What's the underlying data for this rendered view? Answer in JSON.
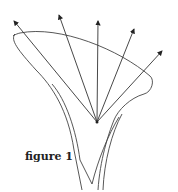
{
  "figure": {
    "caption": "figure 1",
    "stroke_color": "#333333",
    "arrow_count": 5
  }
}
